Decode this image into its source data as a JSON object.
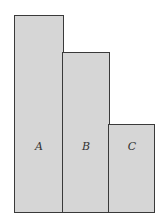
{
  "diagram": {
    "type": "bar-blocks",
    "bars": [
      {
        "label": "A",
        "relative_height": 197
      },
      {
        "label": "B",
        "relative_height": 160
      },
      {
        "label": "C",
        "relative_height": 88
      }
    ],
    "fill_color": "#d6d6d6",
    "border_color": "#3a3a3a"
  }
}
